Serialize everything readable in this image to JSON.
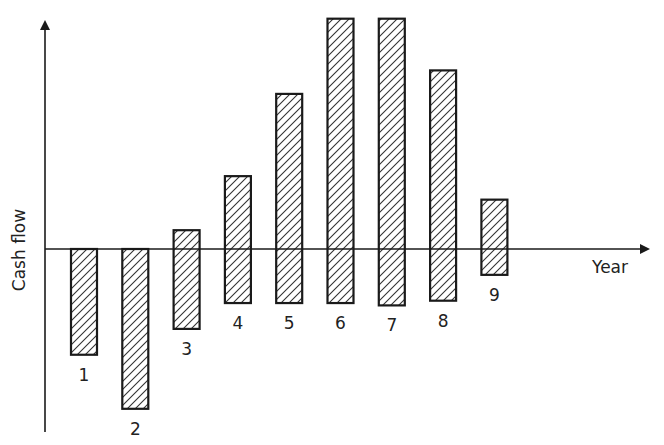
{
  "chart_data": {
    "type": "bar",
    "subtype": "floating",
    "title": "",
    "xlabel": "Year",
    "ylabel": "Cash flow",
    "grid": false,
    "legend": null,
    "categories": [
      "1",
      "2",
      "3",
      "4",
      "5",
      "6",
      "7",
      "8",
      "9"
    ],
    "series": [
      {
        "name": "high",
        "values": [
          0,
          0,
          0.8,
          3.1,
          6.6,
          9.8,
          9.8,
          7.6,
          2.1
        ]
      },
      {
        "name": "low",
        "values": [
          -4.5,
          -6.8,
          -3.4,
          -2.3,
          -2.3,
          -2.3,
          -2.4,
          -2.2,
          -1.1
        ]
      }
    ],
    "ylim": [
      -7.8,
      9.8
    ],
    "units": "arbitrary (no tick labels shown)"
  },
  "style": {
    "stroke": "#1a1a1a",
    "hatch": "#333333",
    "background": "#ffffff"
  }
}
